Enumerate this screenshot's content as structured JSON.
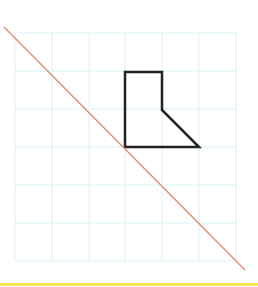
{
  "diagram": {
    "type": "grid-with-shape-and-line",
    "grid": {
      "columns": 6,
      "rows": 6,
      "x_lines": [
        15,
        52,
        89,
        125,
        162,
        199,
        236
      ],
      "y_lines": [
        33,
        71,
        109,
        147,
        185,
        223,
        261
      ],
      "color": "#d6f3f7"
    },
    "shape": {
      "points": "125,72 162,72 162,110 199,147 125,147",
      "stroke": "#222222",
      "stroke_width": 2.5
    },
    "line": {
      "x1": 4,
      "y1": 27,
      "x2": 245,
      "y2": 270,
      "stroke": "#e8866a",
      "stroke_width": 1.3
    },
    "bottom_rule": {
      "y": 284,
      "color": "#f7e55a"
    }
  }
}
